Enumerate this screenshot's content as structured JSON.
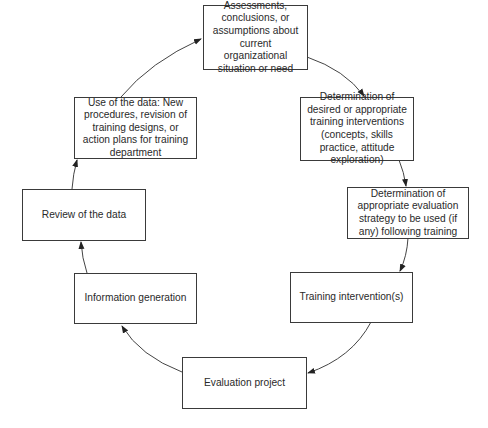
{
  "diagram": {
    "type": "cycle",
    "nodes": [
      {
        "id": "assessments",
        "label": "Assessments, conclusions, or assumptions about current organizational situation or need"
      },
      {
        "id": "determination-interventions",
        "label": "Determination of desired or appropriate training interventions (concepts, skills practice, attitude exploration)"
      },
      {
        "id": "determination-evaluation",
        "label": "Determination of appropriate evaluation strategy to be used (if any) following training"
      },
      {
        "id": "training-intervention",
        "label": "Training intervention(s)"
      },
      {
        "id": "evaluation-project",
        "label": "Evaluation project"
      },
      {
        "id": "information-generation",
        "label": "Information generation"
      },
      {
        "id": "review-data",
        "label": "Review of the data"
      },
      {
        "id": "use-data",
        "label": "Use of the data: New procedures, revision of training designs, or action plans for training department"
      }
    ],
    "edges": [
      {
        "from": "assessments",
        "to": "determination-interventions"
      },
      {
        "from": "determination-interventions",
        "to": "determination-evaluation"
      },
      {
        "from": "determination-evaluation",
        "to": "training-intervention"
      },
      {
        "from": "training-intervention",
        "to": "evaluation-project"
      },
      {
        "from": "evaluation-project",
        "to": "information-generation"
      },
      {
        "from": "information-generation",
        "to": "review-data"
      },
      {
        "from": "review-data",
        "to": "use-data"
      },
      {
        "from": "use-data",
        "to": "assessments"
      }
    ]
  }
}
